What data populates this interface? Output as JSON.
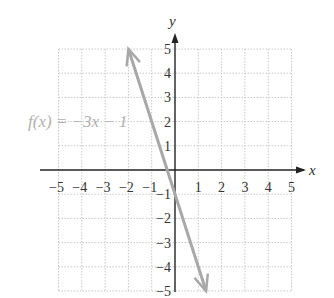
{
  "chart_data": {
    "type": "line",
    "title": "",
    "xlabel": "x",
    "ylabel": "y",
    "xlim": [
      -5,
      5
    ],
    "ylim": [
      -5,
      5
    ],
    "grid": true,
    "x_ticks": [
      -5,
      -4,
      -3,
      -2,
      -1,
      1,
      2,
      3,
      4,
      5
    ],
    "y_ticks": [
      5,
      4,
      3,
      2,
      1,
      -1,
      -2,
      -3,
      -4,
      -5
    ],
    "x_tick_labels": [
      "−5",
      "−4",
      "−3",
      "−2",
      "−1",
      "1",
      "2",
      "3",
      "4",
      "5"
    ],
    "y_tick_labels": [
      "5",
      "4",
      "3",
      "2",
      "1",
      "−1",
      "−2",
      "−3",
      "−4",
      "−5"
    ],
    "series": [
      {
        "name": "f(x) = −3x − 1",
        "equation": "f(x) = -3x - 1",
        "slope": -3,
        "intercept": -1,
        "x": [
          -2,
          -1,
          0,
          1,
          1.333
        ],
        "y": [
          5,
          2,
          -1,
          -4,
          -5
        ],
        "color": "#a8a8a8",
        "arrows_both_ends": true
      }
    ],
    "annotations": [
      {
        "text": "f(x) = −3x − 1",
        "position": "left of line near y=2"
      }
    ]
  },
  "labels": {
    "x_axis": "x",
    "y_axis": "y",
    "function": "f(x) = −3x − 1"
  },
  "colors": {
    "grid": "#c8c8c8",
    "axis": "#222222",
    "line": "#a8a8a8",
    "function_label": "#b0b0b0",
    "tick_text": "#333333"
  }
}
